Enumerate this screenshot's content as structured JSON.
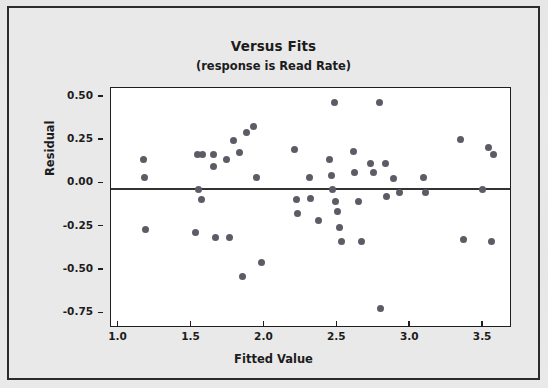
{
  "chart_data": {
    "type": "scatter",
    "title": "Versus Fits",
    "subtitle": "(response is Read Rate)",
    "xlabel": "Fitted Value",
    "ylabel": "Residual",
    "xlim": [
      0.9,
      3.65
    ],
    "ylim": [
      -0.8,
      0.585
    ],
    "xticks": [
      "1.0",
      "1.5",
      "2.0",
      "2.5",
      "3.0",
      "3.5"
    ],
    "xtick_values": [
      1.0,
      1.5,
      2.0,
      2.5,
      3.0,
      3.5
    ],
    "yticks": [
      "0.50",
      "0.25",
      "0.00",
      "-0.25",
      "-0.50",
      "-0.75"
    ],
    "ytick_values": [
      0.5,
      0.25,
      0.0,
      -0.25,
      -0.5,
      -0.75
    ],
    "grid": false,
    "legend": "none",
    "reference_line": {
      "axis": "y",
      "value": 0.0,
      "color": "#333333"
    },
    "marker_color": "#5c5c66",
    "points": [
      {
        "x": 1.12,
        "y": 0.17
      },
      {
        "x": 1.13,
        "y": 0.07
      },
      {
        "x": 1.14,
        "y": -0.23
      },
      {
        "x": 1.49,
        "y": 0.2
      },
      {
        "x": 1.5,
        "y": 0.0
      },
      {
        "x": 1.53,
        "y": 0.2
      },
      {
        "x": 1.52,
        "y": -0.06
      },
      {
        "x": 1.48,
        "y": -0.25
      },
      {
        "x": 1.6,
        "y": 0.2
      },
      {
        "x": 1.6,
        "y": 0.13
      },
      {
        "x": 1.62,
        "y": -0.28
      },
      {
        "x": 1.69,
        "y": 0.17
      },
      {
        "x": 1.74,
        "y": 0.28
      },
      {
        "x": 1.71,
        "y": -0.28
      },
      {
        "x": 1.78,
        "y": 0.21
      },
      {
        "x": 1.8,
        "y": -0.5
      },
      {
        "x": 1.83,
        "y": 0.33
      },
      {
        "x": 1.88,
        "y": 0.36
      },
      {
        "x": 1.9,
        "y": 0.07
      },
      {
        "x": 1.93,
        "y": -0.42
      },
      {
        "x": 2.16,
        "y": 0.23
      },
      {
        "x": 2.17,
        "y": -0.06
      },
      {
        "x": 2.18,
        "y": -0.14
      },
      {
        "x": 2.26,
        "y": 0.07
      },
      {
        "x": 2.27,
        "y": -0.05
      },
      {
        "x": 2.32,
        "y": -0.18
      },
      {
        "x": 2.4,
        "y": 0.17
      },
      {
        "x": 2.41,
        "y": 0.08
      },
      {
        "x": 2.43,
        "y": 0.5
      },
      {
        "x": 2.42,
        "y": 0.0
      },
      {
        "x": 2.44,
        "y": -0.07
      },
      {
        "x": 2.45,
        "y": -0.13
      },
      {
        "x": 2.47,
        "y": -0.22
      },
      {
        "x": 2.48,
        "y": -0.3
      },
      {
        "x": 2.56,
        "y": 0.22
      },
      {
        "x": 2.57,
        "y": 0.1
      },
      {
        "x": 2.6,
        "y": -0.07
      },
      {
        "x": 2.62,
        "y": -0.3
      },
      {
        "x": 2.68,
        "y": 0.15
      },
      {
        "x": 2.7,
        "y": 0.1
      },
      {
        "x": 2.74,
        "y": 0.5
      },
      {
        "x": 2.75,
        "y": -0.69
      },
      {
        "x": 2.78,
        "y": 0.15
      },
      {
        "x": 2.79,
        "y": -0.04
      },
      {
        "x": 2.84,
        "y": 0.06
      },
      {
        "x": 2.88,
        "y": -0.02
      },
      {
        "x": 3.04,
        "y": 0.07
      },
      {
        "x": 3.06,
        "y": -0.02
      },
      {
        "x": 3.3,
        "y": 0.29
      },
      {
        "x": 3.32,
        "y": -0.29
      },
      {
        "x": 3.45,
        "y": 0.0
      },
      {
        "x": 3.49,
        "y": 0.24
      },
      {
        "x": 3.52,
        "y": 0.2
      },
      {
        "x": 3.51,
        "y": -0.3
      }
    ]
  }
}
